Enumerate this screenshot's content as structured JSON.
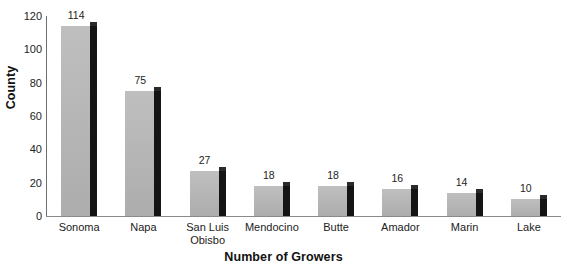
{
  "chart_data": {
    "type": "bar",
    "title": "",
    "subtitle": "",
    "xlabel": "Number of Growers",
    "ylabel": "County",
    "orientation": "vertical",
    "grid": false,
    "legend": false,
    "legend_position": "none",
    "ylim": [
      0,
      120
    ],
    "yticks": [
      0,
      20,
      40,
      60,
      80,
      100,
      120
    ],
    "ytick_labels": [
      "0",
      "20",
      "40",
      "60",
      "80",
      "100",
      "120"
    ],
    "categories": [
      "Sonoma",
      "Napa",
      "San Luis\nObisbo",
      "Mendocino",
      "Butte",
      "Amador",
      "Marin",
      "Lake"
    ],
    "values": [
      114,
      75,
      27,
      18,
      18,
      16,
      14,
      10
    ],
    "data_labels": [
      "114",
      "75",
      "27",
      "18",
      "18",
      "16",
      "14",
      "10"
    ],
    "series": [
      {
        "name": "Number of Growers",
        "values": [
          114,
          75,
          27,
          18,
          18,
          16,
          14,
          10
        ]
      }
    ],
    "colors": {
      "bar_face": "#b6b6b6",
      "bar_side": "#141414",
      "bar_top": "#2a2a2a",
      "axis": "#6f6f6f",
      "text": "#232323",
      "background": "#ffffff"
    }
  }
}
